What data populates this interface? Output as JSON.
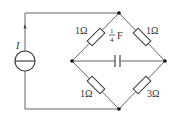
{
  "diagram": {
    "type": "circuit",
    "source": {
      "label": "I",
      "kind": "current-source"
    },
    "components": [
      {
        "id": "R_top_left",
        "label": "1Ω"
      },
      {
        "id": "R_top_right",
        "label": "1Ω"
      },
      {
        "id": "R_bottom_left",
        "label": "1Ω"
      },
      {
        "id": "R_bottom_right",
        "label": "3Ω"
      },
      {
        "id": "C_middle",
        "label_num": "1",
        "label_den": "4",
        "label_unit": "F"
      }
    ],
    "colors": {
      "wire": "#555555",
      "node": "#111111",
      "text": "#333333"
    }
  }
}
